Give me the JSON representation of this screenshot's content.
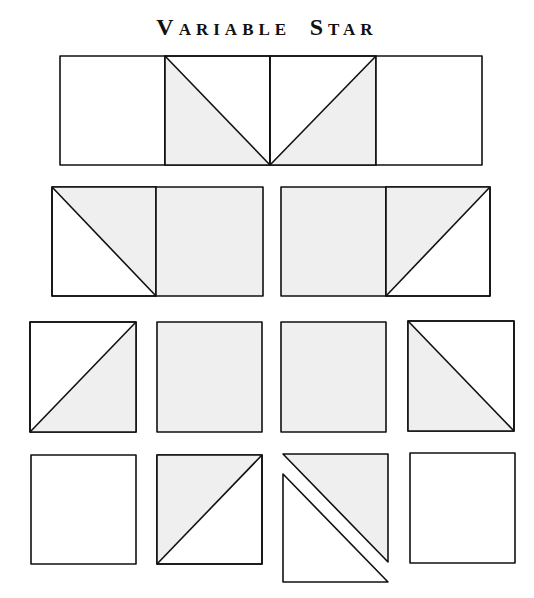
{
  "title": {
    "first_initial": "V",
    "first_rest": "ARIABLE",
    "second_initial": "S",
    "second_rest": "TAR"
  },
  "colors": {
    "shade": "#efefef",
    "stroke": "#111111",
    "background": "#ffffff"
  },
  "diagram": {
    "rows": [
      {
        "row": 1,
        "pieces": [
          "plain square",
          "half-square triangle (shaded lower-left)",
          "half-square triangle (shaded lower-right)",
          "plain square"
        ],
        "joined": true
      },
      {
        "row": 2,
        "pieces": [
          "pair: half-square triangle (shaded upper-right) + shaded square",
          "pair: shaded square + half-square triangle (shaded upper-left)"
        ],
        "joined": "pairs"
      },
      {
        "row": 3,
        "pieces": [
          "half-square triangle (shaded lower-right)",
          "shaded square",
          "shaded square",
          "half-square triangle (shaded lower-left)"
        ],
        "joined": false
      },
      {
        "row": 4,
        "pieces": [
          "plain square",
          "half-square triangle (shaded upper-left)",
          "separated triangles (shaded upper-right, plain lower-left)",
          "plain square"
        ],
        "joined": false
      }
    ]
  }
}
